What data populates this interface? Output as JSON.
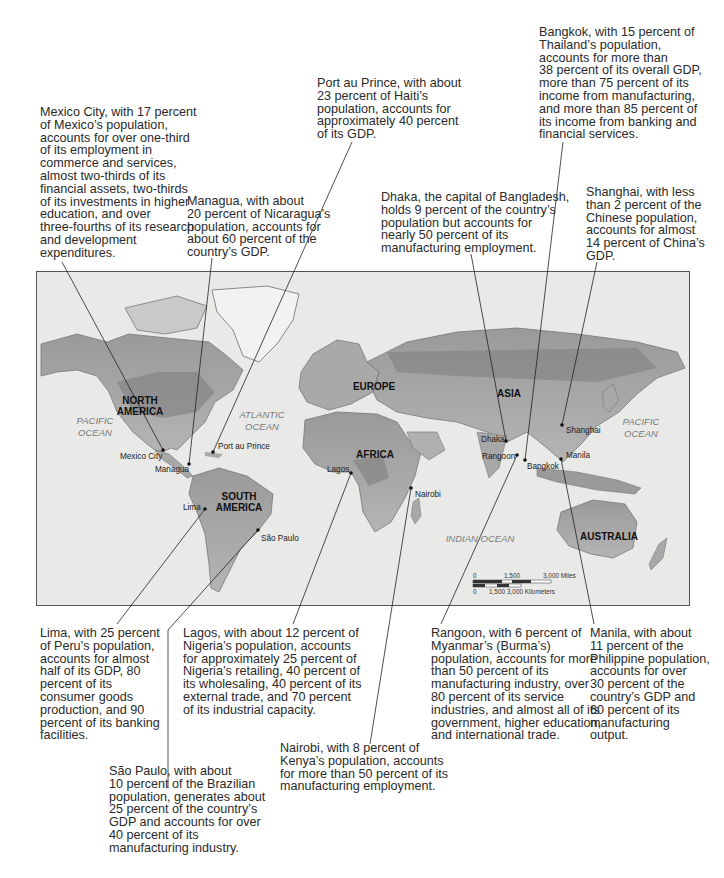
{
  "callouts": {
    "mexico_city": "Mexico City, with 17 percent\nof Mexico’s population,\naccounts for over one-third\nof its employment in\ncommerce and services,\nalmost two-thirds of its\nfinancial assets, two-thirds\nof its investments in higher\neducation, and over\nthree-fourths of its research\nand development\nexpenditures.",
    "managua": "Managua, with about\n20 percent of Nicaragua’s\npopulation, accounts for\nabout 60 percent of the\ncountry’s GDP.",
    "port_au_prince": "Port au Prince, with about\n23 percent of Haiti’s\npopulation, accounts for\napproximately 40 percent\nof its GDP.",
    "dhaka": "Dhaka, the capital of Bangladesh,\nholds 9 percent of the country’s\npopulation but accounts for\nnearly 50 percent of its\nmanufacturing employment.",
    "bangkok": "Bangkok, with 15 percent of\nThailand’s population,\naccounts for more than\n38 percent of its overall GDP,\nmore than 75 percent of its\nincome from manufacturing,\nand more than 85 percent of\nits income from banking and\nfinancial services.",
    "shanghai": "Shanghai, with less\nthan 2 percent of the\nChinese population,\naccounts for almost\n14 percent of China’s\nGDP.",
    "lima": "Lima, with 25 percent\nof Peru’s population,\naccounts for almost\nhalf of its GDP, 80\npercent of its\nconsumer goods\nproduction, and 90\npercent of its banking\nfacilities.",
    "lagos": "Lagos, with about 12 percent of\nNigeria’s population, accounts\nfor approximately 25 percent of\nNigeria’s retailing, 40 percent of\nits wholesaling, 40 percent of its\nexternal trade, and 70 percent\nof its industrial capacity.",
    "sao_paulo": "São Paulo, with about\n10 percent of the Brazilian\npopulation, generates about\n25 percent of the country’s\nGDP and accounts for over\n40 percent of its\nmanufacturing industry.",
    "nairobi": "Nairobi, with 8 percent of\nKenya’s population, accounts\nfor more than 50 percent of its\nmanufacturing employment.",
    "rangoon": "Rangoon, with 6 percent of\nMyanmar’s (Burma’s)\npopulation, accounts for more\nthan 50 percent of its\nmanufacturing industry, over\n80 percent of its service\nindustries, and almost all of its\ngovernment, higher education,\nand international trade.",
    "manila": "Manila, with about\n11 percent of the\nPhilippine population,\naccounts for over\n30 percent of the\ncountry’s GDP and\n60 percent of its\nmanufacturing\noutput."
  },
  "map": {
    "continents": {
      "north_america": [
        "NORTH",
        "AMERICA"
      ],
      "south_america": [
        "SOUTH",
        "AMERICA"
      ],
      "europe": "EUROPE",
      "africa": "AFRICA",
      "asia": "ASIA",
      "australia": "AUSTRALIA"
    },
    "oceans": {
      "pacific_west": [
        "PACIFIC",
        "OCEAN"
      ],
      "atlantic": [
        "ATLANTIC",
        "OCEAN"
      ],
      "indian": "INDIAN OCEAN",
      "pacific_east": [
        "PACIFIC",
        "OCEAN"
      ]
    },
    "cities": {
      "mexico_city": "Mexico City",
      "managua": "Managua",
      "port_au_prince": "Port au Prince",
      "lima": "Lima",
      "sao_paulo": "São Paulo",
      "lagos": "Lagos",
      "nairobi": "Nairobi",
      "dhaka": "Dhaka",
      "rangoon": "Rangoon",
      "bangkok": "Bangkok",
      "shanghai": "Shanghai",
      "manila": "Manila"
    },
    "scale_bar": {
      "miles": [
        "0",
        "1,500",
        "3,000 Miles"
      ],
      "kilometers": [
        "0",
        "1,500",
        "3,000 Kilometers"
      ]
    }
  }
}
